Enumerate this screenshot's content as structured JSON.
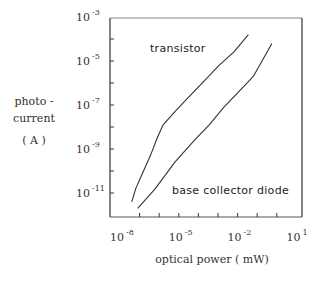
{
  "chart_data": {
    "type": "line",
    "title": "",
    "xlabel": "optical power ( mW)",
    "ylabel": [
      "photo -",
      "current",
      "( A )"
    ],
    "xscale": "log",
    "yscale": "log",
    "xlim": [
      1e-08,
      10
    ],
    "ylim": [
      1e-12,
      0.001
    ],
    "x_ticks": [
      {
        "base": "10",
        "exp": "-8",
        "value": -8
      },
      {
        "base": "10",
        "exp": "-5",
        "value": -5
      },
      {
        "base": "10",
        "exp": "-2",
        "value": -2
      },
      {
        "base": "10",
        "exp": "1",
        "value": 1
      }
    ],
    "y_ticks": [
      {
        "base": "10",
        "exp": "-3",
        "value": -3
      },
      {
        "base": "10",
        "exp": "-5",
        "value": -5
      },
      {
        "base": "10",
        "exp": "-7",
        "value": -7
      },
      {
        "base": "10",
        "exp": "-9",
        "value": -9
      },
      {
        "base": "10",
        "exp": "-11",
        "value": -11
      }
    ],
    "grid": false,
    "legend": "none (direct labels)",
    "series": [
      {
        "name": "transistor",
        "log10_x": [
          -7.4,
          -7.2,
          -6.85,
          -6.45,
          -6.1,
          -5.8,
          -5.2,
          -4.45,
          -3.7,
          -2.95,
          -2.2,
          -1.45
        ],
        "log10_y": [
          -11.4,
          -10.8,
          -10.1,
          -9.3,
          -8.5,
          -7.9,
          -7.3,
          -6.6,
          -5.9,
          -5.2,
          -4.6,
          -3.8
        ]
      },
      {
        "name": "base collector diode",
        "log10_x": [
          -7.1,
          -6.7,
          -6.2,
          -5.7,
          -5.2,
          -4.7,
          -4.2,
          -3.45,
          -2.7,
          -1.95,
          -1.2,
          -0.25
        ],
        "log10_y": [
          -11.7,
          -11.3,
          -10.8,
          -10.2,
          -9.6,
          -9.1,
          -8.6,
          -7.9,
          -7.1,
          -6.4,
          -5.7,
          -4.2
        ]
      }
    ],
    "annotations": [
      {
        "text": "transistor",
        "near_series": "transistor"
      },
      {
        "text": "base collector diode",
        "near_series": "base collector diode"
      }
    ]
  },
  "colors": {
    "line": "#333333",
    "frame": "#444444",
    "background": "#ffffff"
  }
}
